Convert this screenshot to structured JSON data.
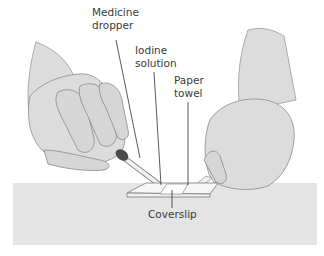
{
  "figure": {
    "labels": {
      "medicine_dropper": [
        "Medicine",
        "dropper"
      ],
      "iodine_solution": [
        "Iodine",
        "solution"
      ],
      "paper_towel": [
        "Paper",
        "towel"
      ],
      "coverslip": "Coverslip"
    },
    "colors": {
      "background": "#ffffff",
      "table": "#e4e4e4",
      "skin": "#dcdcdc",
      "skin_shadow": "#cfcfcf",
      "outline": "#8a8a8a",
      "leader_line": "#2e2e2e",
      "dropper_bulb": "#4a4a4a",
      "slide": "#f7f7f7",
      "coverslip": "#ffffff",
      "text": "#3a3a3a"
    }
  }
}
